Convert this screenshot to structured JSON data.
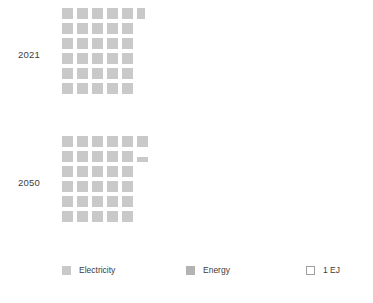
{
  "chart_data": {
    "type": "waffle",
    "title": "",
    "subtitle": "",
    "xlabel": "",
    "ylabel": "",
    "unit": "EJ",
    "unit_label": "1 EJ",
    "cell_value": 1,
    "grid": {
      "columns": 6,
      "rows": 6,
      "fill_order": "row-major-top-down"
    },
    "categories": [
      "2021",
      "2050"
    ],
    "series": [
      {
        "name": "Electricity",
        "color": "#c9c9c9",
        "values": [
          30.6,
          31.4
        ]
      },
      {
        "name": "Energy",
        "color": "#b3b3b3",
        "values": [
          30.6,
          31.4
        ]
      }
    ],
    "groups": [
      {
        "label": "2021",
        "total_cells": 31,
        "full_cells": 30,
        "partial_cells": 1,
        "value": 30.6,
        "rows": [
          {
            "full": 5,
            "partial": "width",
            "partial_fraction": 0.7
          },
          {
            "full": 5,
            "partial": null
          },
          {
            "full": 5,
            "partial": null
          },
          {
            "full": 5,
            "partial": null
          },
          {
            "full": 5,
            "partial": null
          },
          {
            "full": 5,
            "partial": null
          }
        ]
      },
      {
        "label": "2050",
        "total_cells": 32,
        "full_cells": 31,
        "partial_cells": 1,
        "value": 31.4,
        "rows": [
          {
            "full": 6,
            "partial": null
          },
          {
            "full": 5,
            "partial": "height",
            "partial_fraction": 0.45
          },
          {
            "full": 5,
            "partial": null
          },
          {
            "full": 5,
            "partial": null
          },
          {
            "full": 5,
            "partial": null
          },
          {
            "full": 5,
            "partial": null
          }
        ]
      }
    ],
    "legend": {
      "position": "bottom",
      "items": [
        {
          "label": "Electricity",
          "swatch": "filled",
          "color": "#c9c9c9"
        },
        {
          "label": "Energy",
          "swatch": "filled",
          "color": "#b3b3b3"
        },
        {
          "label": "1 EJ",
          "swatch": "outline",
          "color": "#ffffff"
        }
      ]
    },
    "grid_visible": false,
    "axes_visible": false
  },
  "colors": {
    "electricity": "#c9c9c9",
    "energy": "#b3b3b3",
    "unit_outline": "#9e9e9e",
    "text": "#3c3c3c",
    "background": "#ffffff"
  }
}
